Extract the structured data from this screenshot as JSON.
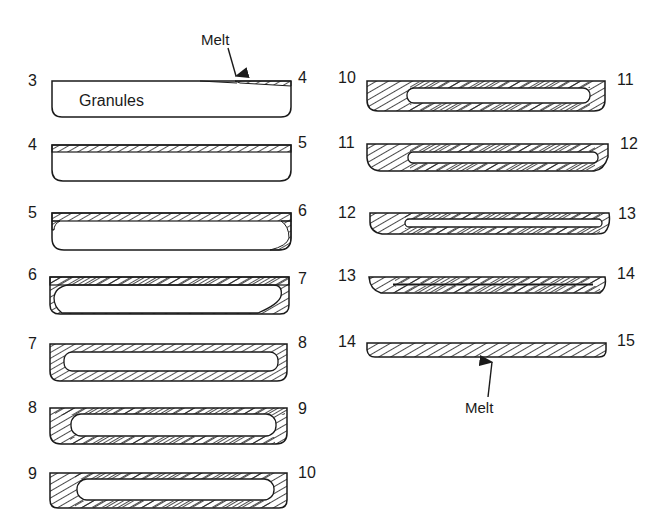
{
  "diagram": {
    "type": "melting-sequence-cross-sections",
    "colors": {
      "stroke": "#1a1a1a",
      "background": "#ffffff"
    },
    "annotations": {
      "top_melt": "Melt",
      "granules": "Granules",
      "bottom_melt": "Melt"
    },
    "left_column": [
      {
        "start": "3",
        "end": "4",
        "state": "granules, thin melt film starting at right"
      },
      {
        "start": "4",
        "end": "5",
        "state": "melt layer on top"
      },
      {
        "start": "5",
        "end": "6",
        "state": "melt on top and right corner"
      },
      {
        "start": "6",
        "end": "7",
        "state": "melt on top, sides and corners"
      },
      {
        "start": "7",
        "end": "8",
        "state": "melt shell surrounding granules"
      },
      {
        "start": "8",
        "end": "9",
        "state": "thicker melt shell"
      },
      {
        "start": "9",
        "end": "10",
        "state": "thicker melt shell"
      }
    ],
    "right_column": [
      {
        "start": "10",
        "end": "11",
        "state": "granule core shrinking"
      },
      {
        "start": "11",
        "end": "12",
        "state": "narrow granule core"
      },
      {
        "start": "12",
        "end": "13",
        "state": "narrow granule core"
      },
      {
        "start": "13",
        "end": "14",
        "state": "thin line of granules"
      },
      {
        "start": "14",
        "end": "15",
        "state": "fully melted"
      }
    ]
  }
}
